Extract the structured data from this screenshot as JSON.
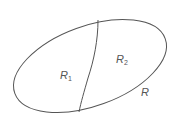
{
  "diagram": {
    "type": "region-partition",
    "regions": [
      {
        "id": "R1",
        "label": "R",
        "subscript": "1"
      },
      {
        "id": "R2",
        "label": "R",
        "subscript": "2"
      }
    ],
    "outer_label": "R",
    "stroke_color": "#555555",
    "background": "#ffffff"
  }
}
